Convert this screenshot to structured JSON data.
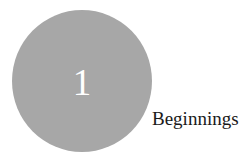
{
  "chapter": {
    "number": "1",
    "title": "Beginnings",
    "circle_color": "#a7a7a7",
    "number_color": "#ffffff",
    "title_color": "#1a1a1a"
  }
}
